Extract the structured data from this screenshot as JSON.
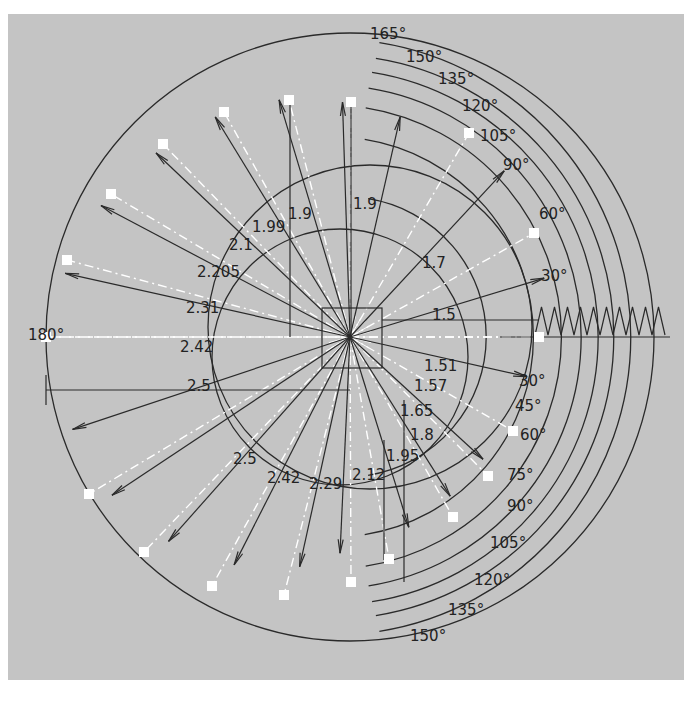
{
  "diagram": {
    "type": "cam-profile-construction",
    "center": {
      "x": 350,
      "y": 337
    },
    "colors": {
      "background": "#c4c4c4",
      "page": "#ffffff",
      "ink": "#2a2a2a",
      "construction": "#ffffff"
    },
    "base_circle_box": {
      "x": 322,
      "y": 308,
      "w": 60,
      "h": 60
    },
    "angle_labels_upper": [
      {
        "text": "165°",
        "x": 370,
        "y": 39
      },
      {
        "text": "150°",
        "x": 406,
        "y": 62
      },
      {
        "text": "135°",
        "x": 438,
        "y": 84
      },
      {
        "text": "120°",
        "x": 462,
        "y": 111
      },
      {
        "text": "105°",
        "x": 480,
        "y": 141
      },
      {
        "text": "90°",
        "x": 503,
        "y": 170
      },
      {
        "text": "60°",
        "x": 539,
        "y": 219
      },
      {
        "text": "30°",
        "x": 541,
        "y": 281
      },
      {
        "text": "180°",
        "x": 28,
        "y": 340
      }
    ],
    "angle_labels_lower": [
      {
        "text": "30°",
        "x": 519,
        "y": 386
      },
      {
        "text": "45°",
        "x": 515,
        "y": 411
      },
      {
        "text": "60°",
        "x": 520,
        "y": 440
      },
      {
        "text": "75°",
        "x": 507,
        "y": 480
      },
      {
        "text": "90°",
        "x": 507,
        "y": 511
      },
      {
        "text": "105°",
        "x": 490,
        "y": 548
      },
      {
        "text": "120°",
        "x": 474,
        "y": 585
      },
      {
        "text": "135°",
        "x": 448,
        "y": 615
      },
      {
        "text": "150°",
        "x": 410,
        "y": 641
      }
    ],
    "radius_labels": [
      {
        "text": "1.9",
        "x": 288,
        "y": 219
      },
      {
        "text": "1.9",
        "x": 353,
        "y": 209
      },
      {
        "text": "1.99",
        "x": 252,
        "y": 232
      },
      {
        "text": "2.1",
        "x": 229,
        "y": 250
      },
      {
        "text": "2.205",
        "x": 197,
        "y": 277
      },
      {
        "text": "2.31",
        "x": 186,
        "y": 313
      },
      {
        "text": "2.42",
        "x": 180,
        "y": 352
      },
      {
        "text": "2.5",
        "x": 187,
        "y": 391
      },
      {
        "text": "1.7",
        "x": 422,
        "y": 268
      },
      {
        "text": "1.5",
        "x": 432,
        "y": 320
      },
      {
        "text": "1.51",
        "x": 424,
        "y": 371
      },
      {
        "text": "1.57",
        "x": 414,
        "y": 391
      },
      {
        "text": "1.65",
        "x": 400,
        "y": 416
      },
      {
        "text": "1.8",
        "x": 410,
        "y": 440
      },
      {
        "text": "1.95",
        "x": 386,
        "y": 461
      },
      {
        "text": "2.12",
        "x": 352,
        "y": 480
      },
      {
        "text": "2.29",
        "x": 309,
        "y": 489
      },
      {
        "text": "2.42",
        "x": 267,
        "y": 483
      },
      {
        "text": "2.5",
        "x": 233,
        "y": 464
      }
    ],
    "markers": [
      {
        "x": 539,
        "y": 337
      },
      {
        "x": 534,
        "y": 233
      },
      {
        "x": 469,
        "y": 133
      },
      {
        "x": 351,
        "y": 102
      },
      {
        "x": 289,
        "y": 100
      },
      {
        "x": 224,
        "y": 112
      },
      {
        "x": 163,
        "y": 144
      },
      {
        "x": 111,
        "y": 194
      },
      {
        "x": 67,
        "y": 260
      },
      {
        "x": 46,
        "y": 337
      },
      {
        "x": 89,
        "y": 494
      },
      {
        "x": 144,
        "y": 552
      },
      {
        "x": 212,
        "y": 586
      },
      {
        "x": 284,
        "y": 595
      },
      {
        "x": 351,
        "y": 582
      },
      {
        "x": 389,
        "y": 559
      },
      {
        "x": 453,
        "y": 517
      },
      {
        "x": 488,
        "y": 476
      },
      {
        "x": 513,
        "y": 431
      }
    ],
    "arc_radii": [
      140,
      200,
      232,
      252,
      268,
      282,
      298
    ],
    "displacement_baseline": {
      "x1": 500,
      "x2": 670,
      "y": 337
    }
  }
}
